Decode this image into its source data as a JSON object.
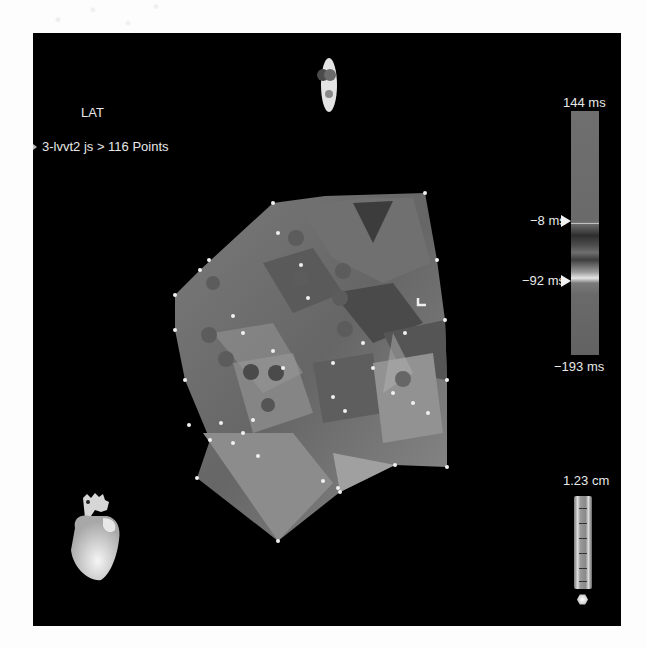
{
  "map": {
    "title": "LAT",
    "subtitle": "3-lvvt2 js > 116 Points",
    "point_count": 116
  },
  "colorbar": {
    "max_label": "144 ms",
    "min_label": "−193 ms",
    "markers": [
      {
        "label": "−8 ms",
        "icon": "triangle-right-icon"
      },
      {
        "label": "−92 ms",
        "icon": "triangle-right-icon"
      }
    ]
  },
  "scale": {
    "label": "1.23 cm"
  },
  "icons": {
    "orientation": "orientation-indicator-icon",
    "heart": "heart-model-icon",
    "ruler": "scale-ruler-icon",
    "hex": "hexagon-icon",
    "cursor": "l-marker-icon"
  },
  "colors": {
    "panel_background": "#000000",
    "page_background": "#fdfdfd",
    "text": "#e8e8e8",
    "mesh_base": "#6e6e6e"
  }
}
